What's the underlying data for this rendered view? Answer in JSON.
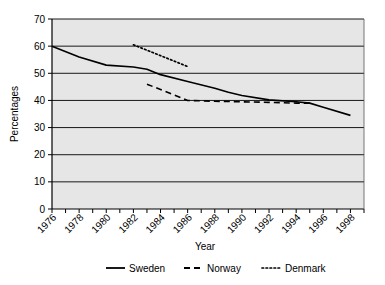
{
  "chart_data": {
    "type": "line",
    "title": "",
    "xlabel": "Year",
    "ylabel": "Percentages",
    "xlim": [
      1976,
      1999
    ],
    "ylim": [
      0,
      70
    ],
    "ytick_step": 10,
    "yticks": [
      "0",
      "10",
      "20",
      "30",
      "40",
      "50",
      "60",
      "70"
    ],
    "xticks": [
      "1976",
      "1978",
      "1980",
      "1982",
      "1984",
      "1986",
      "1988",
      "1990",
      "1992",
      "1994",
      "1996",
      "1998"
    ],
    "xtick_minor_step": 1,
    "grid": "horizontal",
    "legend_position": "bottom",
    "plot_background": "#e8e8e8",
    "line_color": "#000000",
    "series": [
      {
        "name": "Sweden",
        "style": "solid",
        "x": [
          1976,
          1978,
          1980,
          1982,
          1983,
          1984,
          1986,
          1988,
          1989,
          1990,
          1992,
          1994,
          1995,
          1996,
          1998
        ],
        "values": [
          60.0,
          56.0,
          53.0,
          52.3,
          51.5,
          49.5,
          47.0,
          44.5,
          43.0,
          41.8,
          40.2,
          39.5,
          39.0,
          37.5,
          34.5
        ]
      },
      {
        "name": "Norway",
        "style": "dashed",
        "x": [
          1983,
          1984,
          1985,
          1986,
          1988,
          1990,
          1992,
          1994,
          1995
        ],
        "values": [
          46.0,
          44.0,
          42.0,
          40.0,
          39.7,
          39.5,
          39.3,
          39.0,
          39.0
        ]
      },
      {
        "name": "Denmark",
        "style": "dotted",
        "x": [
          1982,
          1983,
          1984,
          1985,
          1986
        ],
        "values": [
          60.5,
          58.5,
          56.5,
          54.5,
          52.5
        ]
      }
    ]
  },
  "legend": {
    "items": [
      {
        "label": "Sweden",
        "style": "solid"
      },
      {
        "label": "Norway",
        "style": "dashed"
      },
      {
        "label": "Denmark",
        "style": "dotted"
      }
    ]
  }
}
